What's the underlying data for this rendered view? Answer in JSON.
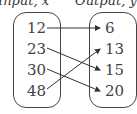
{
  "headers": {
    "input": "Input, x",
    "output": "Output, y"
  },
  "inputs": [
    "12",
    "23",
    "30",
    "48"
  ],
  "outputs": [
    "6",
    "13",
    "15",
    "20"
  ],
  "mapping": [
    [
      "12",
      "6"
    ],
    [
      "23",
      "15"
    ],
    [
      "30",
      "20"
    ],
    [
      "48",
      "13"
    ]
  ]
}
